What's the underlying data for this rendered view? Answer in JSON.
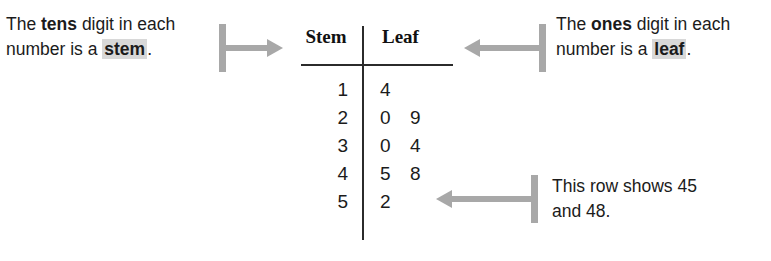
{
  "diagram": {
    "colors": {
      "text": "#1b1b1b",
      "rule": "#2b2b2b",
      "pointer": "#a8a8a8",
      "highlight": "#d8d8d8"
    }
  },
  "callouts": {
    "stem": {
      "line1_pre": "The ",
      "line1_strong": "tens",
      "line1_post": " digit in each",
      "line2_pre": "number is a ",
      "line2_highlight": "stem",
      "line2_post": "."
    },
    "leaf": {
      "line1_pre": "The ",
      "line1_strong": "ones",
      "line1_post": " digit in each",
      "line2_pre": "number is a ",
      "line2_highlight": "leaf",
      "line2_post": "."
    },
    "row": {
      "line1": "This row shows 45",
      "line2": "and 48."
    }
  },
  "plot": {
    "headers": {
      "stem": "Stem",
      "leaf": "Leaf"
    },
    "rows": [
      {
        "stem": "1",
        "leaves": [
          "4"
        ]
      },
      {
        "stem": "2",
        "leaves": [
          "0",
          "9"
        ]
      },
      {
        "stem": "3",
        "leaves": [
          "0",
          "4"
        ]
      },
      {
        "stem": "4",
        "leaves": [
          "5",
          "8"
        ]
      },
      {
        "stem": "5",
        "leaves": [
          "2"
        ]
      }
    ]
  },
  "chart_data": {
    "type": "table",
    "columns": [
      "Stem",
      "Leaf"
    ],
    "stems": [
      1,
      2,
      3,
      4,
      5
    ],
    "leaves": [
      [
        4
      ],
      [
        0,
        9
      ],
      [
        0,
        4
      ],
      [
        5,
        8
      ],
      [
        2
      ]
    ],
    "values": [
      14,
      20,
      29,
      30,
      34,
      45,
      48,
      52
    ],
    "annotations": [
      "The tens digit in each number is a stem.",
      "The ones digit in each number is a leaf.",
      "This row shows 45 and 48."
    ]
  }
}
